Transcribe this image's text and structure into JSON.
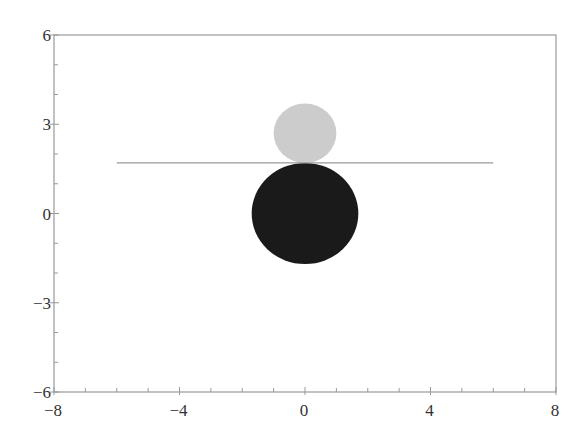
{
  "chart_data": {
    "type": "scatter",
    "title": "",
    "xlabel": "",
    "ylabel": "",
    "xlim": [
      -8,
      8
    ],
    "ylim": [
      -6,
      6
    ],
    "grid": false,
    "legend": null,
    "x_ticks": [
      -8,
      -4,
      0,
      4,
      8
    ],
    "x_tick_labels": [
      "−8",
      "−4",
      "0",
      "4",
      "8"
    ],
    "x_minor_step": 1,
    "y_ticks": [
      -6,
      -3,
      0,
      3,
      6
    ],
    "y_tick_labels": [
      "−6",
      "−3",
      "0",
      "3",
      "6"
    ],
    "y_minor_step": 1,
    "shapes": [
      {
        "kind": "circle",
        "name": "light-circle",
        "center": [
          0,
          2.7
        ],
        "radius": 1.0,
        "color": "#cccccc"
      },
      {
        "kind": "circle",
        "name": "dark-circle",
        "center": [
          0,
          0
        ],
        "radius": 1.7,
        "color": "#1a1a1a"
      },
      {
        "kind": "line",
        "name": "horizontal-line",
        "x": [
          -6,
          6
        ],
        "y": [
          1.7,
          1.7
        ],
        "color": "#999999"
      }
    ]
  },
  "style": {
    "axis_color": "#999999",
    "label_color": "#333333",
    "background": "#ffffff"
  }
}
